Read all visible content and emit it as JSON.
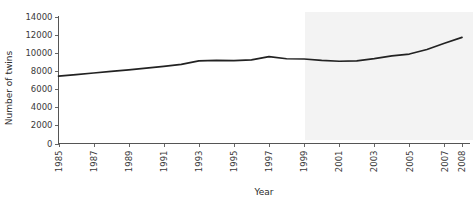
{
  "chart_data": {
    "type": "line",
    "title": "",
    "xlabel": "Year",
    "ylabel": "Number of twins",
    "xlim": [
      1985,
      2008
    ],
    "ylim": [
      0,
      14000
    ],
    "grid": false,
    "legend": null,
    "ytick_labels": [
      "0",
      "2000",
      "4000",
      "6000",
      "8000",
      "10000",
      "12000",
      "14000"
    ],
    "ytick_values": [
      0,
      2000,
      4000,
      6000,
      8000,
      10000,
      12000,
      14000
    ],
    "xtick_labels": [
      "1985",
      "1987",
      "1989",
      "1991",
      "1993",
      "1995",
      "1997",
      "1999",
      "2001",
      "2003",
      "2005",
      "2007",
      "2008"
    ],
    "xtick_values": [
      1985,
      1987,
      1989,
      1991,
      1993,
      1995,
      1997,
      1999,
      2001,
      2003,
      2005,
      2007,
      2008
    ],
    "x": [
      1985,
      1986,
      1987,
      1988,
      1989,
      1990,
      1991,
      1992,
      1993,
      1994,
      1995,
      1996,
      1997,
      1998,
      1999,
      2000,
      2001,
      2002,
      2003,
      2004,
      2005,
      2006,
      2007,
      2008
    ],
    "values": [
      7450,
      7620,
      7800,
      7980,
      8150,
      8340,
      8530,
      8750,
      9150,
      9200,
      9180,
      9250,
      9620,
      9380,
      9350,
      9200,
      9100,
      9150,
      9400,
      9700,
      9900,
      10400,
      11100,
      11750
    ],
    "series": [
      {
        "name": "Number of twins",
        "color": "#222222",
        "values": [
          7450,
          7620,
          7800,
          7980,
          8150,
          8340,
          8530,
          8750,
          9150,
          9200,
          9180,
          9250,
          9620,
          9380,
          9350,
          9200,
          9100,
          9150,
          9400,
          9700,
          9900,
          10400,
          11100,
          11750
        ]
      }
    ]
  },
  "axes": {
    "x_title": "Year",
    "y_title": "Number of twins"
  },
  "watermark": {
    "text": "",
    "color": "#f3f3f3"
  }
}
